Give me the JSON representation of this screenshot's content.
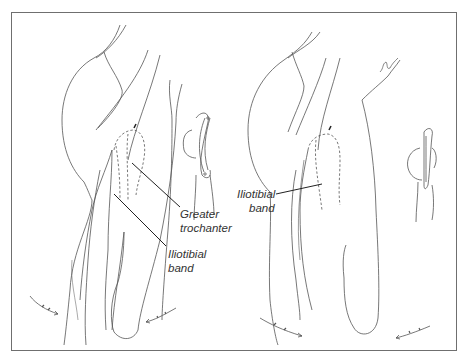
{
  "figure": {
    "panels": [
      {
        "id": "left",
        "labels": [
          {
            "line1": "Greater",
            "line2": "trochanter"
          },
          {
            "line1": "Iliotibial",
            "line2": "band"
          }
        ]
      },
      {
        "id": "right",
        "labels": [
          {
            "line1": "Iliotibial",
            "line2": "band"
          }
        ]
      }
    ],
    "colors": {
      "line": "#555555",
      "border": "#6f6f6f",
      "background": "#ffffff"
    }
  }
}
